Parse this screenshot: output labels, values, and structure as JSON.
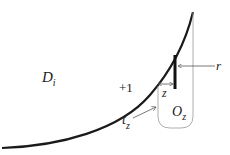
{
  "diagram": {
    "labels": {
      "domain": "D",
      "domain_sub": "i",
      "plus_one": "+1",
      "z": "z",
      "r": "r",
      "t": "t",
      "t_sub": "z",
      "o": "O",
      "o_sub": "z"
    },
    "colors": {
      "curve": "#1a1a1a",
      "bar": "#111111",
      "thin_line": "#9a9a9a",
      "arrow": "#555555",
      "text": "#222222"
    }
  }
}
